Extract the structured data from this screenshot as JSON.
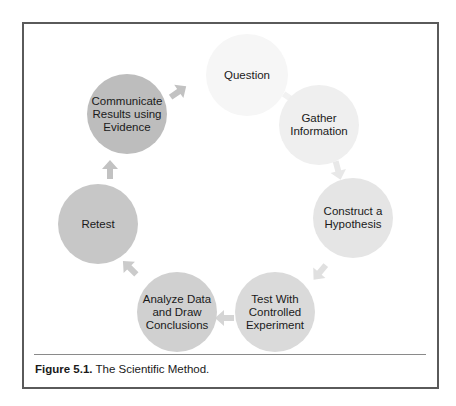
{
  "figure": {
    "nodes": [
      {
        "id": "question",
        "label": "Question",
        "cx": 247,
        "cy": 75,
        "r": 41,
        "fill": "#f6f6f6"
      },
      {
        "id": "gather-information",
        "label": "Gather\nInformation",
        "cx": 319,
        "cy": 125,
        "r": 40,
        "fill": "#efefef"
      },
      {
        "id": "construct-hypothesis",
        "label": "Construct a\nHypothesis",
        "cx": 353,
        "cy": 218,
        "r": 40,
        "fill": "#e5e5e5"
      },
      {
        "id": "test-controlled-experiment",
        "label": "Test With\nControlled\nExperiment",
        "cx": 275,
        "cy": 312,
        "r": 40,
        "fill": "#dadada"
      },
      {
        "id": "analyze-data",
        "label": "Analyze Data\nand Draw\nConclusions",
        "cx": 177,
        "cy": 312,
        "r": 40,
        "fill": "#d0d0d0"
      },
      {
        "id": "retest",
        "label": "Retest",
        "cx": 98,
        "cy": 224,
        "r": 40,
        "fill": "#c7c7c7"
      },
      {
        "id": "communicate-results",
        "label": "Communicate\nResults using\nEvidence",
        "cx": 127,
        "cy": 114,
        "r": 40,
        "fill": "#bdbdbd"
      }
    ],
    "arrows": [
      {
        "from": "communicate-results",
        "to": "question",
        "x": 178,
        "y": 92,
        "angle": -35,
        "fill": "#c2c2c2"
      },
      {
        "from": "question",
        "to": "gather-information",
        "x": 291,
        "y": 99,
        "angle": 35,
        "fill": "#f2f2f2"
      },
      {
        "from": "gather-information",
        "to": "construct-hypothesis",
        "x": 338,
        "y": 170,
        "angle": 75,
        "fill": "#e8e8e8"
      },
      {
        "from": "construct-hypothesis",
        "to": "test-controlled-experiment",
        "x": 320,
        "y": 272,
        "angle": 130,
        "fill": "#e0e0e0"
      },
      {
        "from": "test-controlled-experiment",
        "to": "analyze-data",
        "x": 225,
        "y": 318,
        "angle": 180,
        "fill": "#d5d5d5"
      },
      {
        "from": "analyze-data",
        "to": "retest",
        "x": 130,
        "y": 268,
        "angle": -135,
        "fill": "#cbcbcb"
      },
      {
        "from": "retest",
        "to": "communicate-results",
        "x": 110,
        "y": 170,
        "angle": -90,
        "fill": "#c2c2c2"
      }
    ]
  },
  "caption": {
    "label": "Figure 5.1.",
    "text": " The Scientific Method."
  }
}
